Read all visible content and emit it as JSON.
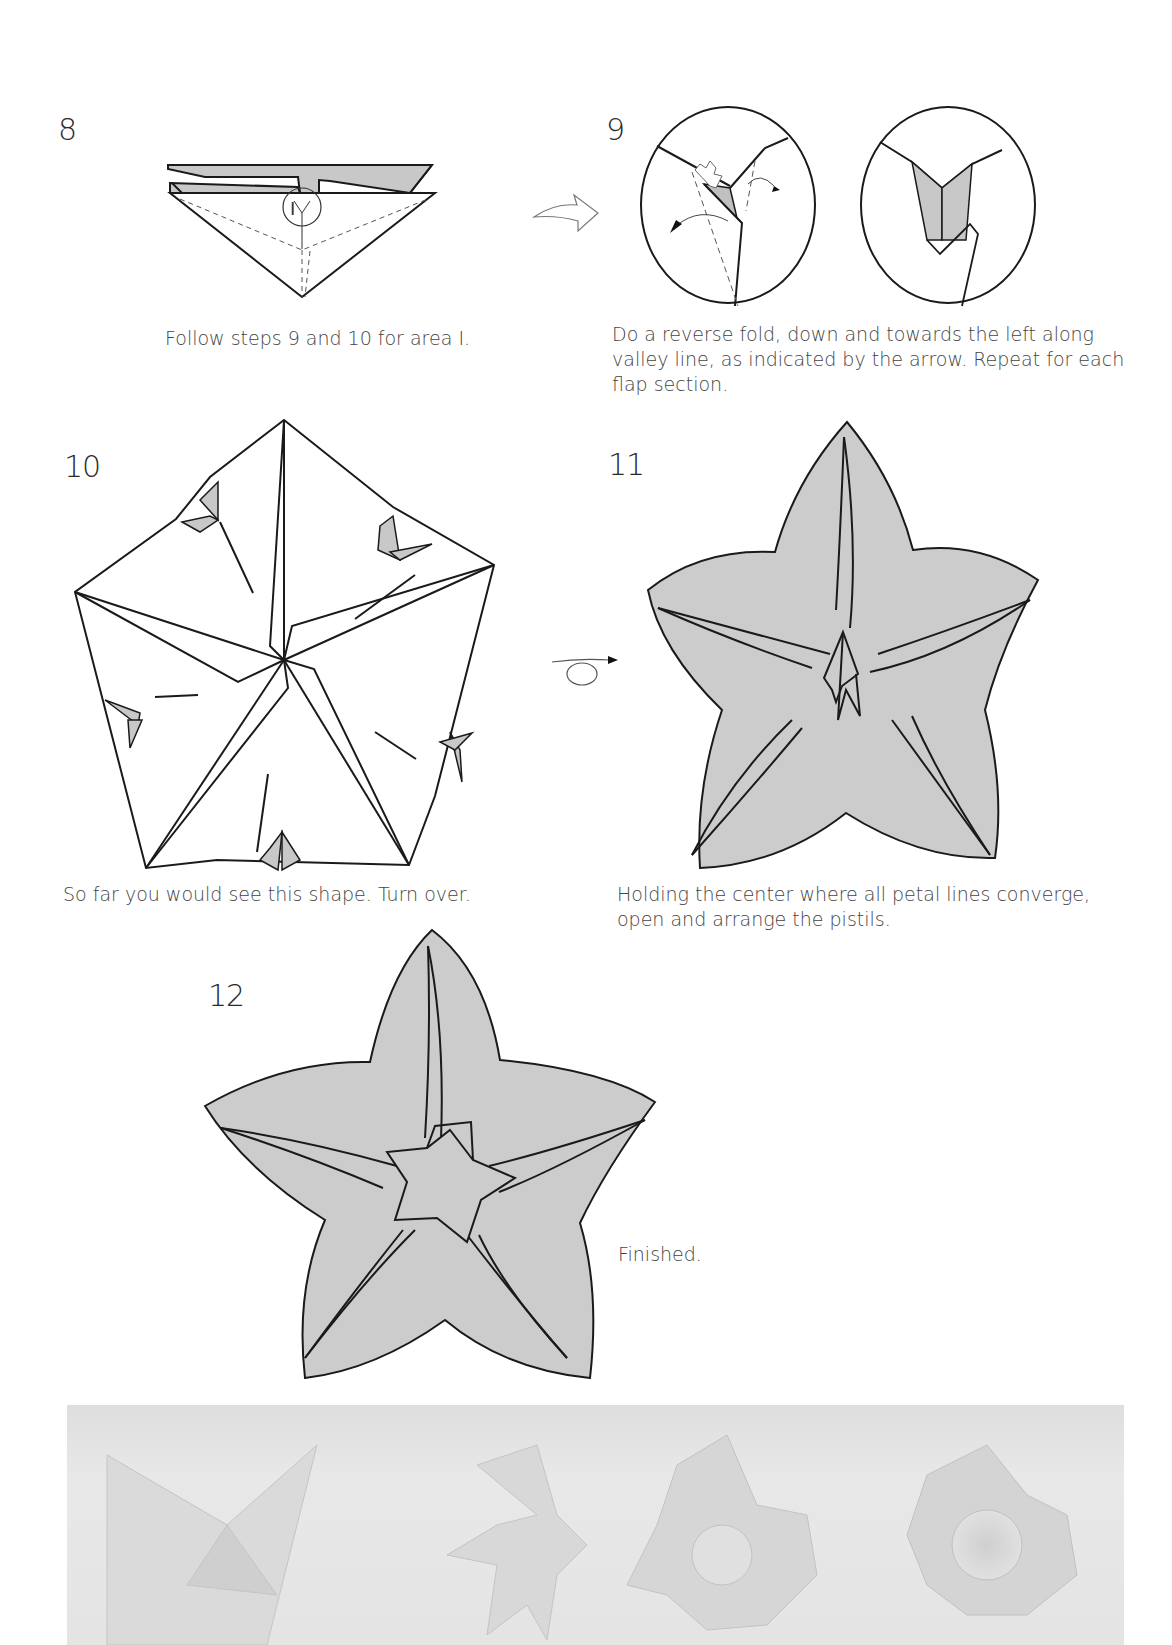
{
  "page": {
    "type": "origami instructions page",
    "colors": {
      "paper_fill": "#cccccc",
      "line": "#1a1a1a",
      "fold_shade": "#c8c8c8",
      "photo_bg": "#e2e2e2"
    }
  },
  "steps": [
    {
      "number": "8",
      "caption": "Follow steps 9 and 10 for area I.",
      "label_area": "I"
    },
    {
      "number": "9",
      "caption": "Do a reverse fold, down and towards the left along valley line, as indicated by the arrow. Repeat for each flap section."
    },
    {
      "number": "10",
      "caption": "So far you would see this shape. Turn over."
    },
    {
      "number": "11",
      "caption": "Holding the center where all petal lines converge, open and arrange the pistils."
    },
    {
      "number": "12",
      "caption": "Finished."
    }
  ],
  "icons": {
    "step8_to_9": "hollow-curved-arrow-icon",
    "step10_to_11": "turn-over-arrow-icon"
  },
  "photo": {
    "description": "Four folded white paper flowers in varying stages",
    "count": 4
  }
}
